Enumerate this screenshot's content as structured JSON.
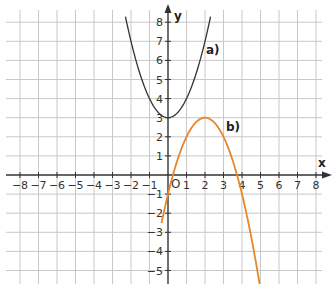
{
  "chart_data": {
    "type": "line",
    "title": "",
    "xlabel": "x",
    "ylabel": "y",
    "xlim": [
      -8,
      8
    ],
    "ylim": [
      -5.5,
      8.5
    ],
    "grid": true,
    "x_ticks": [
      "-8",
      "-7",
      "-6",
      "-5",
      "-4",
      "-3",
      "-2",
      "-1",
      "1",
      "2",
      "3",
      "4",
      "5",
      "6",
      "7",
      "8"
    ],
    "y_ticks": [
      "8",
      "7",
      "6",
      "5",
      "4",
      "3",
      "2",
      "1",
      "-1",
      "-2",
      "-3",
      "-4",
      "-5"
    ],
    "origin_label": "O",
    "series": [
      {
        "name": "a)",
        "color": "#333333",
        "equation": "y = x^2 + 3",
        "vertex": [
          0,
          3
        ],
        "x_range": [
          -2.3,
          2.3
        ]
      },
      {
        "name": "b)",
        "color": "#e8862a",
        "equation": "y = -(x-2)^2 + 3",
        "vertex": [
          2,
          3
        ],
        "x_range": [
          -0.35,
          4.95
        ]
      }
    ],
    "annotations": [
      {
        "text": "a)",
        "x": 1.9,
        "y": 6.5
      },
      {
        "text": "b)",
        "x": 3.2,
        "y": 2.5
      }
    ]
  }
}
